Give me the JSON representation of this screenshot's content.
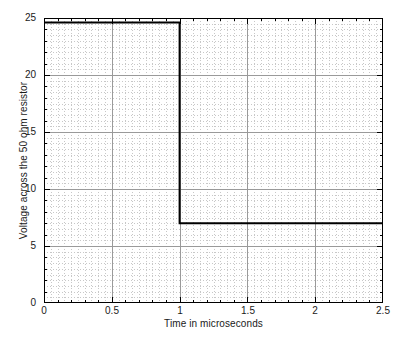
{
  "chart_data": {
    "type": "line",
    "title": "",
    "subtitle": "",
    "xlabel": "Time in microseconds",
    "ylabel": "Voltage across the 50 ohm resistor",
    "xlim": [
      0,
      2.5
    ],
    "ylim": [
      0,
      25
    ],
    "x_major_ticks": [
      0,
      0.5,
      1,
      1.5,
      2,
      2.5
    ],
    "x_tick_labels": [
      "0",
      "0.5",
      "1",
      "1.5",
      "2",
      "2.5"
    ],
    "y_major_ticks": [
      0,
      5,
      10,
      15,
      20,
      25
    ],
    "y_tick_labels": [
      "0",
      "5",
      "10",
      "15",
      "20",
      "25"
    ],
    "x_minor_step": 0.05,
    "y_minor_step": 0.5,
    "grid": true,
    "grid_style": "dotted-minor-and-major",
    "legend": null,
    "legend_position": "none",
    "line_color": "#000000",
    "line_width_px": 2,
    "series": [
      {
        "name": "Voltage across the 50 ohm resistor",
        "x": [
          0,
          1,
          1,
          2.5
        ],
        "values": [
          24.6,
          24.6,
          7.0,
          7.0
        ],
        "description": "Step down from 24.6 V to 7.0 V at t = 1 microsecond"
      }
    ],
    "annotations": [
      {
        "text": "high level",
        "value": 24.6
      },
      {
        "text": "low level",
        "value": 7.0
      },
      {
        "text": "step time",
        "value": 1
      }
    ]
  },
  "figure": {
    "background_color": "#ffffff",
    "axes_color": "#000000",
    "grid_major_color": "#9a9a9a",
    "grid_minor_color": "#c8c8c8"
  }
}
